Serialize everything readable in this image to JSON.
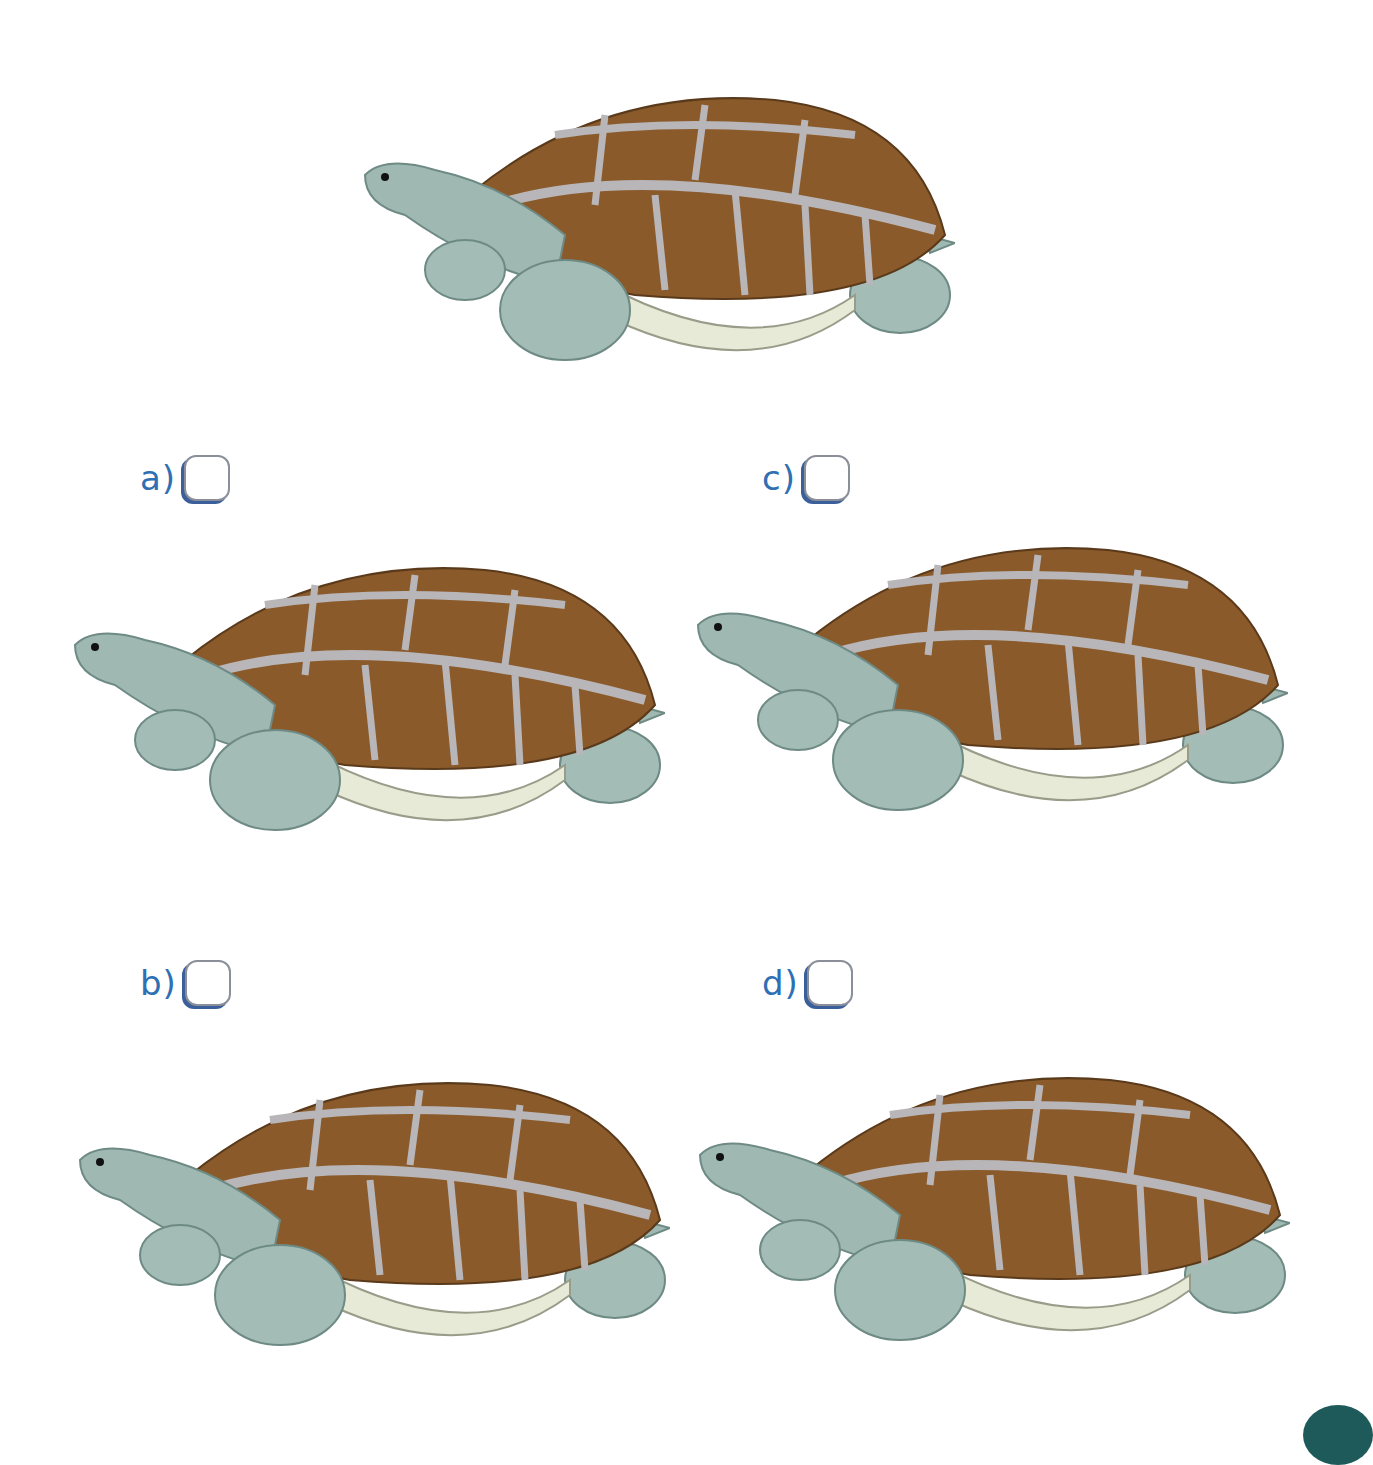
{
  "worksheet": {
    "reference": {
      "label": "reference-turtle"
    },
    "options": [
      {
        "letter": "a)",
        "checked": false
      },
      {
        "letter": "b)",
        "checked": false
      },
      {
        "letter": "c)",
        "checked": false
      },
      {
        "letter": "d)",
        "checked": false
      }
    ]
  },
  "colors": {
    "label_blue": "#2f6fb3",
    "shell_brown": "#8a5a2b",
    "shell_seam": "#b8b6b8",
    "skin": "#9fb8b2",
    "belly": "#e8ead8"
  }
}
